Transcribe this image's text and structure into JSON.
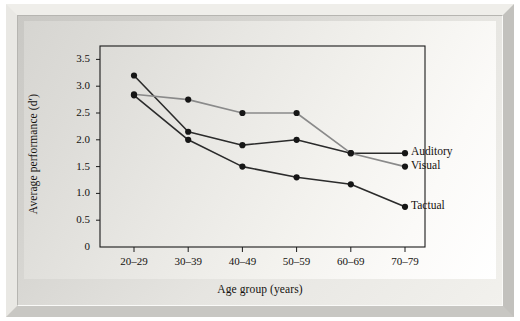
{
  "chart_data": {
    "type": "line",
    "title": "",
    "xlabel": "Age group (years)",
    "ylabel": "Average performance (d′)",
    "categories": [
      "20–29",
      "30–39",
      "40–49",
      "50–59",
      "60–69",
      "70–79"
    ],
    "ytick_labels": [
      "0",
      "0.5",
      "1.0",
      "1.5",
      "2.0",
      "2.5",
      "3.0",
      "3.5"
    ],
    "ytick_values": [
      0,
      0.5,
      1.0,
      1.5,
      2.0,
      2.5,
      3.0,
      3.5
    ],
    "ylim": [
      0,
      3.75
    ],
    "grid": false,
    "legend_position": "right-inline",
    "series": [
      {
        "name": "Auditory",
        "color": "#2b2b2b",
        "values": [
          3.2,
          2.15,
          1.9,
          2.0,
          1.75,
          1.75
        ]
      },
      {
        "name": "Visual",
        "color": "#8a8a8a",
        "values": [
          2.85,
          2.75,
          2.5,
          2.5,
          1.75,
          1.5
        ]
      },
      {
        "name": "Tactual",
        "color": "#2b2b2b",
        "values": [
          2.83,
          2.0,
          1.5,
          1.3,
          1.17,
          0.75
        ]
      }
    ]
  },
  "colors": {
    "axis": "#1a1a1a",
    "frame_light": "#efeeea",
    "frame_dark": "#c2c1bd",
    "plot_background": "#e7e6e2",
    "text": "#14120f"
  }
}
